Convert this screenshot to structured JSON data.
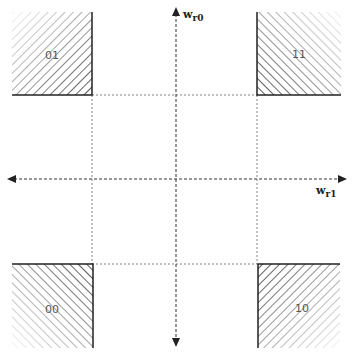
{
  "diagram": {
    "axes": {
      "vertical": {
        "label": "w",
        "subscript": "r0"
      },
      "horizontal": {
        "label": "w",
        "subscript": "r1"
      }
    },
    "regions": [
      {
        "id": "01",
        "label": "01",
        "position": "top-left"
      },
      {
        "id": "11",
        "label": "11",
        "position": "top-right"
      },
      {
        "id": "00",
        "label": "00",
        "position": "bottom-left"
      },
      {
        "id": "10",
        "label": "10",
        "position": "bottom-right"
      }
    ],
    "colors": {
      "hatch": "#222222",
      "axis": "#333333",
      "guide": "#555555",
      "label": "#555555"
    }
  }
}
